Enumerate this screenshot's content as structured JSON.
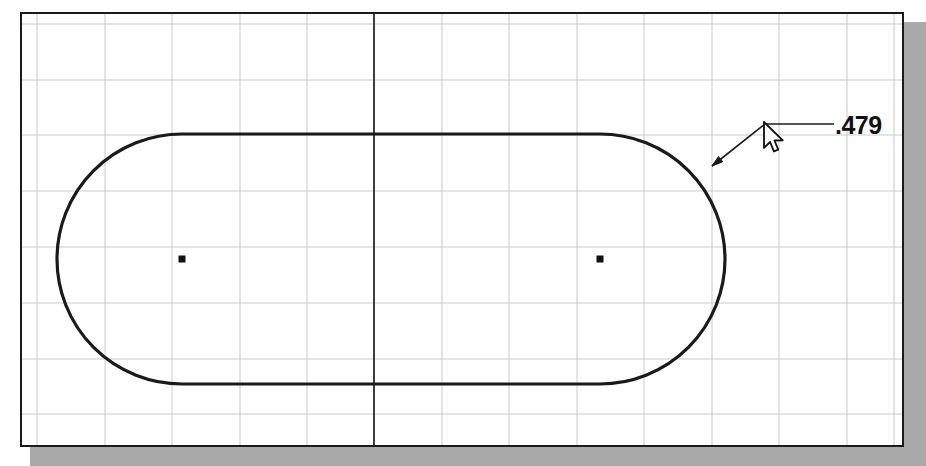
{
  "app": {
    "window_title": "",
    "background_color": "#ffffff",
    "border_color": "#1a1a1a",
    "shadow_color": "#9a9a9a"
  },
  "canvas": {
    "grid": {
      "visible": true,
      "minor_color": "#c9c9c9",
      "minor_spacing_x": 67,
      "minor_spacing_y": 55,
      "vertical_lines_x": [
        15,
        83,
        150,
        218,
        285,
        352,
        420,
        487,
        555,
        622,
        690,
        757,
        825,
        872
      ],
      "horizontal_lines_y": [
        10,
        66,
        121,
        177,
        233,
        289,
        345,
        400
      ],
      "axis_color": "#2b2b2b",
      "axis_x": 352,
      "axis_label": "centerline"
    },
    "geometry": {
      "type": "slot",
      "outline_color": "#1a1a1a",
      "outline_width": 3.2,
      "left_center": {
        "x": 160,
        "y": 245
      },
      "right_center": {
        "x": 578,
        "y": 245
      },
      "radius": 125,
      "top_line_y": 120,
      "bottom_line_y": 370,
      "center_mark_size": 7,
      "center_mark_color": "#111111"
    },
    "annotation": {
      "dimension_value": ".479",
      "leader": {
        "arrow_tip": {
          "x": 690,
          "y": 152
        },
        "elbow": {
          "x": 743,
          "y": 110
        },
        "shelf_end": {
          "x": 812,
          "y": 110
        },
        "color": "#1a1a1a"
      },
      "text_position": {
        "x": 813,
        "y": 120
      }
    },
    "cursor": {
      "type": "arrow-pointer",
      "tip": {
        "x": 742,
        "y": 108
      },
      "fill": "#ffffff",
      "stroke": "#111111"
    }
  }
}
